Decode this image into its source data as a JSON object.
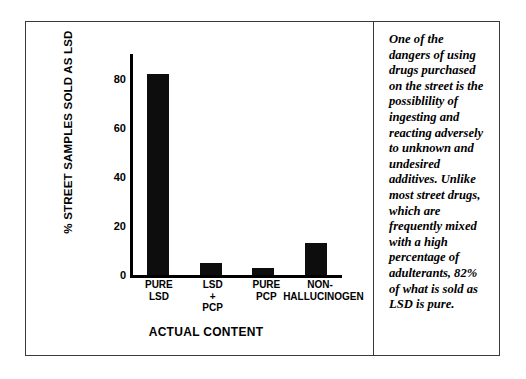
{
  "figure": {
    "caption": "One of the dangers of using drugs purchased on the street is the possiblility of ingesting and reacting adversely to unknown and undesired additives. Unlike most street drugs, which are frequently mixed with a high percentage of adulterants, 82% of what is sold as LSD is pure."
  },
  "chart_data": {
    "type": "bar",
    "title": "",
    "xlabel": "ACTUAL CONTENT",
    "ylabel": "% STREET SAMPLES SOLD AS LSD",
    "categories": [
      "PURE LSD",
      "LSD + PCP",
      "PURE PCP",
      "NON-HALLUCINOGEN"
    ],
    "category_lines": [
      [
        "PURE",
        "LSD"
      ],
      [
        "LSD",
        "+",
        "PCP"
      ],
      [
        "PURE",
        "PCP"
      ],
      [
        "NON-",
        "HALLUCINOGEN"
      ]
    ],
    "values": [
      82,
      5,
      3,
      13
    ],
    "ylim": [
      0,
      90
    ],
    "yticks": [
      0,
      20,
      40,
      60,
      80
    ],
    "ytick_labels": [
      "0",
      "20",
      "40",
      "60",
      "80"
    ],
    "grid": false,
    "legend": false,
    "bar_color": "#0d0d0d"
  }
}
